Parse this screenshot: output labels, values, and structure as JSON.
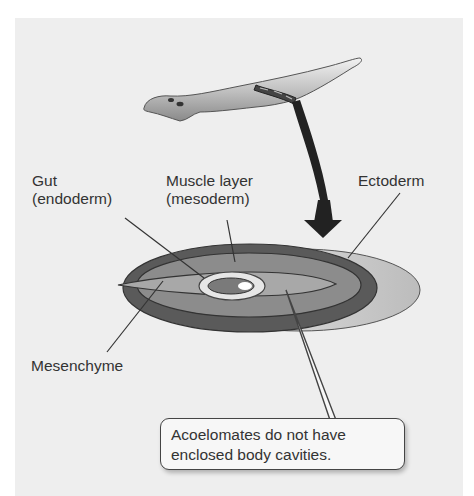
{
  "diagram": {
    "labels": {
      "gut": [
        "Gut",
        "(endoderm)"
      ],
      "muscle": [
        "Muscle layer",
        "(mesoderm)"
      ],
      "ectoderm": "Ectoderm",
      "mesenchyme": "Mesenchyme"
    },
    "callout": [
      "Acoelomates do not have",
      "enclosed body cavities."
    ],
    "colors": {
      "panel_bg": "#eeeeee",
      "ectoderm_outer": "#5a5a5a",
      "muscle_layer": "#8c8c8c",
      "mesenchyme": "#a8a8a8",
      "gut_ring": "#e6e6e6",
      "arrow": "#222222"
    }
  }
}
